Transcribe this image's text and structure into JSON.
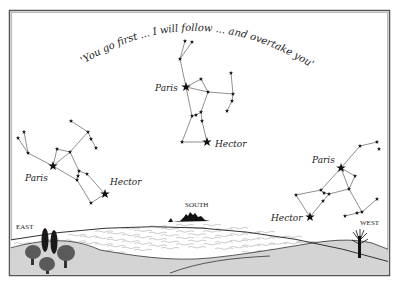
{
  "figure": {
    "quote": "'You go first ... I will follow ... and overtake you'",
    "colors": {
      "background": "#ffffff",
      "frame": "#555555",
      "frame_inner": "#bbbbbb",
      "ink": "#222222",
      "ground": "#d4d4d4",
      "sea_lines": "#888888",
      "tree": "#5a5a5a",
      "cypress": "#1a1a1a"
    },
    "directions": {
      "east": "EAST",
      "south": "SOUTH",
      "west": "WEST"
    },
    "constellations": [
      {
        "id": "left",
        "paris_label": "Paris",
        "hector_label": "Hector",
        "paris": [
          53,
          166
        ],
        "hector": [
          105,
          194
        ],
        "label_paris_pos": [
          25,
          181
        ],
        "label_hector_pos": [
          110,
          185
        ],
        "stars": [
          [
            18,
            138
          ],
          [
            24,
            132
          ],
          [
            28,
            153
          ],
          [
            57,
            149
          ],
          [
            70,
            152
          ],
          [
            71,
            121
          ],
          [
            88,
            132
          ],
          [
            91,
            139
          ],
          [
            96,
            148
          ],
          [
            79,
            171
          ],
          [
            78,
            176
          ],
          [
            87,
            174
          ],
          [
            77,
            180
          ],
          [
            91,
            203
          ]
        ],
        "lines": [
          [
            [
              18,
              138
            ],
            [
              28,
              153
            ]
          ],
          [
            [
              24,
              132
            ],
            [
              28,
              153
            ]
          ],
          [
            [
              28,
              153
            ],
            [
              53,
              166
            ]
          ],
          [
            [
              53,
              166
            ],
            [
              57,
              149
            ]
          ],
          [
            [
              57,
              149
            ],
            [
              70,
              152
            ]
          ],
          [
            [
              53,
              166
            ],
            [
              70,
              152
            ]
          ],
          [
            [
              70,
              152
            ],
            [
              88,
              132
            ]
          ],
          [
            [
              71,
              121
            ],
            [
              88,
              132
            ]
          ],
          [
            [
              88,
              132
            ],
            [
              91,
              139
            ]
          ],
          [
            [
              91,
              139
            ],
            [
              96,
              148
            ]
          ],
          [
            [
              70,
              152
            ],
            [
              79,
              171
            ]
          ],
          [
            [
              53,
              166
            ],
            [
              77,
              180
            ]
          ],
          [
            [
              79,
              171
            ],
            [
              78,
              176
            ]
          ],
          [
            [
              78,
              176
            ],
            [
              77,
              180
            ]
          ],
          [
            [
              79,
              171
            ],
            [
              87,
              174
            ]
          ],
          [
            [
              87,
              174
            ],
            [
              105,
              194
            ]
          ],
          [
            [
              77,
              180
            ],
            [
              91,
              203
            ]
          ],
          [
            [
              91,
              203
            ],
            [
              105,
              194
            ]
          ]
        ]
      },
      {
        "id": "top",
        "paris_label": "Paris",
        "hector_label": "Hector",
        "paris": [
          186,
          87
        ],
        "hector": [
          207,
          142
        ],
        "label_paris_pos": [
          155,
          91
        ],
        "label_hector_pos": [
          215,
          147
        ],
        "stars": [
          [
            185,
            41
          ],
          [
            192,
            42
          ],
          [
            180,
            59
          ],
          [
            201,
            79
          ],
          [
            208,
            92
          ],
          [
            231,
            73
          ],
          [
            233,
            94
          ],
          [
            232,
            101
          ],
          [
            227,
            111
          ],
          [
            192,
            116
          ],
          [
            196,
            115
          ],
          [
            201,
            112
          ],
          [
            202,
            121
          ],
          [
            182,
            142
          ]
        ],
        "lines": [
          [
            [
              185,
              41
            ],
            [
              180,
              59
            ]
          ],
          [
            [
              192,
              42
            ],
            [
              180,
              59
            ]
          ],
          [
            [
              180,
              59
            ],
            [
              186,
              87
            ]
          ],
          [
            [
              186,
              87
            ],
            [
              201,
              79
            ]
          ],
          [
            [
              201,
              79
            ],
            [
              208,
              92
            ]
          ],
          [
            [
              186,
              87
            ],
            [
              208,
              92
            ]
          ],
          [
            [
              208,
              92
            ],
            [
              233,
              94
            ]
          ],
          [
            [
              231,
              73
            ],
            [
              233,
              94
            ]
          ],
          [
            [
              233,
              94
            ],
            [
              232,
              101
            ]
          ],
          [
            [
              232,
              101
            ],
            [
              227,
              111
            ]
          ],
          [
            [
              186,
              87
            ],
            [
              192,
              116
            ]
          ],
          [
            [
              208,
              92
            ],
            [
              201,
              112
            ]
          ],
          [
            [
              192,
              116
            ],
            [
              196,
              115
            ]
          ],
          [
            [
              196,
              115
            ],
            [
              201,
              112
            ]
          ],
          [
            [
              201,
              112
            ],
            [
              202,
              121
            ]
          ],
          [
            [
              202,
              121
            ],
            [
              207,
              142
            ]
          ],
          [
            [
              192,
              116
            ],
            [
              182,
              142
            ]
          ],
          [
            [
              182,
              142
            ],
            [
              207,
              142
            ]
          ]
        ]
      },
      {
        "id": "right",
        "paris_label": "Paris",
        "hector_label": "Hector",
        "paris": [
          341,
          168
        ],
        "hector": [
          310,
          217
        ],
        "label_paris_pos": [
          312,
          163
        ],
        "label_hector_pos": [
          271,
          221
        ],
        "stars": [
          [
            360,
            146
          ],
          [
            377,
            142
          ],
          [
            379,
            149
          ],
          [
            355,
            176
          ],
          [
            349,
            189
          ],
          [
            321,
            190
          ],
          [
            324,
            193
          ],
          [
            329,
            194
          ],
          [
            296,
            195
          ],
          [
            323,
            201
          ],
          [
            377,
            199
          ],
          [
            362,
            212
          ],
          [
            357,
            213
          ],
          [
            345,
            216
          ]
        ],
        "lines": [
          [
            [
              377,
              142
            ],
            [
              360,
              146
            ]
          ],
          [
            [
              360,
              146
            ],
            [
              341,
              168
            ]
          ],
          [
            [
              341,
              168
            ],
            [
              355,
              176
            ]
          ],
          [
            [
              355,
              176
            ],
            [
              349,
              189
            ]
          ],
          [
            [
              341,
              168
            ],
            [
              349,
              189
            ]
          ],
          [
            [
              341,
              168
            ],
            [
              321,
              190
            ]
          ],
          [
            [
              321,
              190
            ],
            [
              324,
              193
            ]
          ],
          [
            [
              324,
              193
            ],
            [
              329,
              194
            ]
          ],
          [
            [
              329,
              194
            ],
            [
              349,
              189
            ]
          ],
          [
            [
              321,
              190
            ],
            [
              296,
              195
            ]
          ],
          [
            [
              296,
              195
            ],
            [
              310,
              217
            ]
          ],
          [
            [
              310,
              217
            ],
            [
              323,
              201
            ]
          ],
          [
            [
              323,
              201
            ],
            [
              329,
              194
            ]
          ],
          [
            [
              349,
              189
            ],
            [
              362,
              212
            ]
          ],
          [
            [
              377,
              199
            ],
            [
              362,
              212
            ]
          ],
          [
            [
              362,
              212
            ],
            [
              357,
              213
            ]
          ],
          [
            [
              357,
              213
            ],
            [
              345,
              216
            ]
          ]
        ]
      }
    ]
  }
}
